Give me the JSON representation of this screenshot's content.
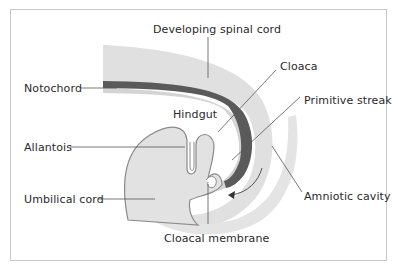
{
  "figure": {
    "type": "anatomical-diagram"
  },
  "labels": {
    "developing_spinal_cord": "Developing spinal cord",
    "cloaca": "Cloaca",
    "notochord": "Notochord",
    "primitive_streak": "Primitive streak",
    "hindgut": "Hindgut",
    "allantois": "Allantois",
    "umbilical_cord": "Umbilical cord",
    "amniotic_cavity": "Amniotic cavity",
    "cloacal_membrane": "Cloacal membrane"
  },
  "colors": {
    "tissue_light": "#e2e2e2",
    "tissue_mid": "#cfcfcf",
    "notochord": "#5a5a5a",
    "outline": "#8a8a8a",
    "leader_line": "#555555",
    "frame": "#c8c8c8",
    "text": "#2a2a2a"
  }
}
